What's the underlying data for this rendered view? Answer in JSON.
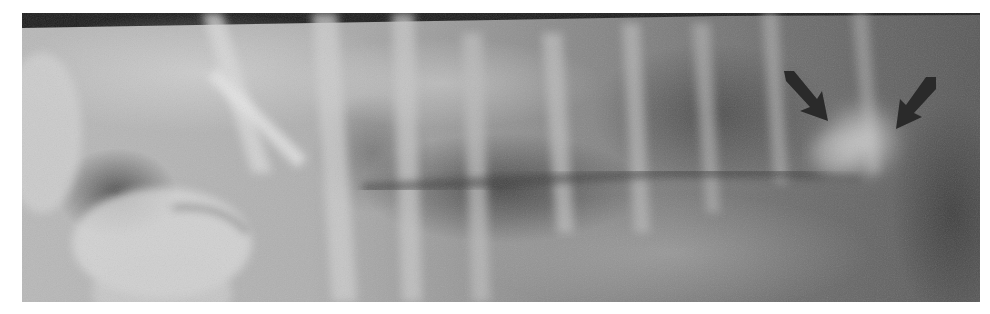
{
  "image": {
    "description": "Lateral thoracic radiograph with two dark arrows marking a rounded soft-tissue opacity in the caudodorsal lung field",
    "frame": {
      "x": 22,
      "y": 13,
      "width": 958,
      "height": 289
    },
    "background_color": "#ffffff",
    "tones": {
      "light": "#d8d8d8",
      "mid": "#8f8f8f",
      "dark": "#3c3c3c",
      "arrow": "#2a2a2a"
    },
    "annotations": [
      {
        "type": "arrow",
        "name": "left-arrow",
        "tip": [
          826,
          112
        ],
        "direction": "down-right"
      },
      {
        "type": "arrow",
        "name": "right-arrow",
        "tip": [
          902,
          130
        ],
        "direction": "down-left"
      }
    ],
    "finding": {
      "type": "round-opacity",
      "center": [
        862,
        140
      ],
      "radius": 42
    }
  }
}
